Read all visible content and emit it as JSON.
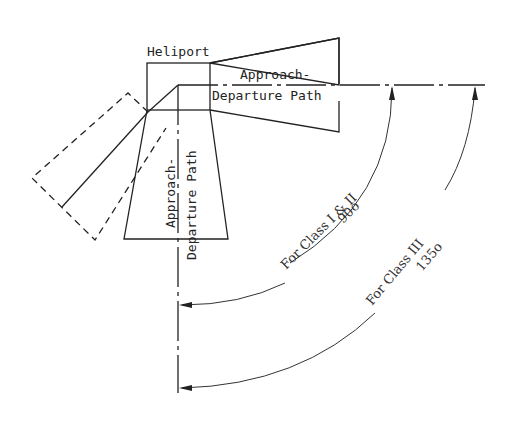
{
  "diagram": {
    "title_label": "Heliport",
    "horizontal_path": {
      "line1": "Approach-",
      "line2": "Departure Path"
    },
    "vertical_path": {
      "line1": "Approach-",
      "line2": "Departure Path"
    },
    "angle_class_1_2": {
      "line1": "For Class I & II",
      "line2": "90o"
    },
    "angle_class_3": {
      "line1": "For Class III",
      "line2": "135o"
    },
    "colors": {
      "stroke": "#222222",
      "background": "#ffffff"
    }
  }
}
